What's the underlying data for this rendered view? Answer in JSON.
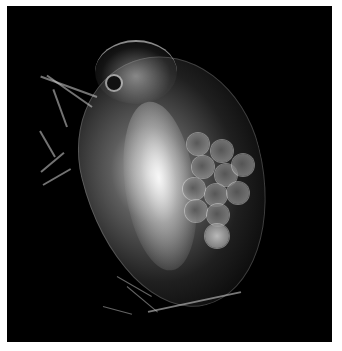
{
  "image": {
    "subject": "daphnia-water-flea",
    "description": "Translucent water flea (Daphnia) on a black background with a cluster of eggs in its brood pouch",
    "background_color": "#000000",
    "border_color": "#ffffff",
    "egg_count_visible": 11
  }
}
